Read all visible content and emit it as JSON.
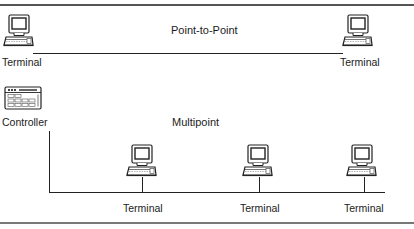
{
  "diagram": {
    "sections": {
      "point_to_point": {
        "title": "Point-to-Point",
        "nodes": [
          {
            "type": "terminal",
            "label": "Terminal"
          },
          {
            "type": "terminal",
            "label": "Terminal"
          }
        ],
        "connections": [
          [
            "terminal-left",
            "terminal-right"
          ]
        ]
      },
      "multipoint": {
        "title": "Multipoint",
        "controller": {
          "type": "controller",
          "label": "Controller"
        },
        "nodes": [
          {
            "type": "terminal",
            "label": "Terminal"
          },
          {
            "type": "terminal",
            "label": "Terminal"
          },
          {
            "type": "terminal",
            "label": "Terminal"
          }
        ],
        "connections": [
          [
            "controller",
            "bus"
          ],
          [
            "bus",
            "terminal-1"
          ],
          [
            "bus",
            "terminal-2"
          ],
          [
            "bus",
            "terminal-3"
          ]
        ]
      }
    },
    "icons": {
      "terminal": "terminal-icon",
      "controller": "controller-icon"
    },
    "colors": {
      "line": "#222222",
      "rule": "#555555",
      "background": "#ffffff"
    }
  }
}
